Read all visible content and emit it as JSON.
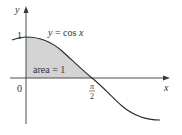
{
  "diagram": {
    "function_label": "y = cos x",
    "function_label_parts": {
      "lhs": "y",
      "eq": " = cos ",
      "var": "x"
    },
    "area_label": "area = 1",
    "y_axis_label": "y",
    "x_axis_label": "x",
    "origin_label": "0",
    "y_tick_label": "1",
    "x_tick_label_num": "π",
    "x_tick_label_den": "2",
    "colors": {
      "curve": "#2a2a2a",
      "shade": "#d4d4d4",
      "axis": "#3a3a3a"
    }
  }
}
